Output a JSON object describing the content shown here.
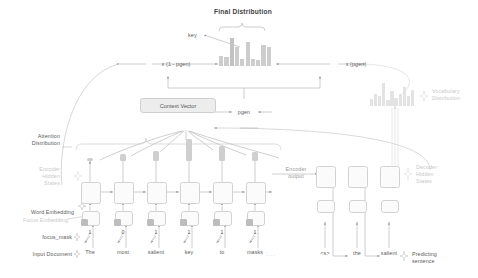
{
  "diagram": {
    "title": "Final Distribution",
    "labels": {
      "key_callout": "key",
      "mult_one_minus_pgen": "x (1 - pgen)",
      "mult_pgen": "x (pgen)",
      "pgen": "pgen",
      "context_vector": "Context Vector",
      "vocabulary_distribution_l1": "Vocabulary",
      "vocabulary_distribution_l2": "Distribution",
      "attention_distribution_l1": "Attention",
      "attention_distribution_l2": "Distribution",
      "encoder_hidden_states_l1": "Encoder",
      "encoder_hidden_states_l2": "Hidden",
      "encoder_hidden_states_l3": "States",
      "decoder_hidden_states_l1": "Decoder",
      "decoder_hidden_states_l2": "Hidden",
      "decoder_hidden_states_l3": "States",
      "encoder_output_l1": "Encoder",
      "encoder_output_l2": "output",
      "word_embedding": "Word Embedding",
      "focus_embedding": "Focus Embedding",
      "focus_mask": "focus_mask",
      "input_document": "Input Document",
      "predicting_sentence_l1": "Predicting",
      "predicting_sentence_l2": "sentence"
    },
    "encoder": {
      "tokens": [
        "The",
        "most",
        "salient",
        "key",
        "to",
        "masks"
      ],
      "ellipsis": "· · ·",
      "focus_mask_values": [
        "1",
        "0",
        "1",
        "1",
        "1",
        "1"
      ],
      "attention_values": [
        0.12,
        0.32,
        0.46,
        1.0,
        0.68,
        0.42
      ]
    },
    "decoder": {
      "tokens": [
        "<s>",
        "the",
        "salient"
      ]
    },
    "chart_data": [
      {
        "type": "bar",
        "name": "final-distribution",
        "title": "Final Distribution",
        "categories": [
          "v1",
          "v2",
          "v3",
          "v4",
          "v5",
          "v6",
          "v7",
          "v8",
          "v9",
          "v10"
        ],
        "values": [
          0.35,
          0.3,
          0.95,
          0.62,
          0.25,
          0.8,
          0.22,
          0.2,
          0.7,
          0.62
        ],
        "highlight_index": 2,
        "highlight_label": "key",
        "grid": false,
        "legend": "none"
      },
      {
        "type": "bar",
        "name": "vocabulary-distribution",
        "title": "Vocabulary Distribution",
        "categories": [
          "v1",
          "v2",
          "v3",
          "v4",
          "v5",
          "v6",
          "v7",
          "v8",
          "v9",
          "v10",
          "v11"
        ],
        "values": [
          0.3,
          0.52,
          0.4,
          0.95,
          0.26,
          0.62,
          0.34,
          0.48,
          0.8,
          0.4,
          0.66
        ],
        "grid": false,
        "legend": "none"
      },
      {
        "type": "bar",
        "name": "attention-distribution",
        "title": "Attention Distribution",
        "categories": [
          "The",
          "most",
          "salient",
          "key",
          "to",
          "masks"
        ],
        "values": [
          0.12,
          0.32,
          0.46,
          1.0,
          0.68,
          0.42
        ],
        "grid": false,
        "legend": "none"
      }
    ],
    "colors": {
      "bar": "#cfcfcf",
      "bar_light": "#e6e6e6",
      "line": "#b5b5b5",
      "box_border": "#d2d2d2",
      "context_fill": "#ededed",
      "text": "#5c5c5c",
      "text_faint": "#c9c9c9"
    }
  }
}
